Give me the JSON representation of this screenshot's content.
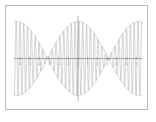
{
  "figure": {
    "background_color": "#ffffff",
    "frame_color": "#b9b9b9",
    "line_color": "#9e9e9e",
    "axis_color": "#8a8a8a",
    "title": "",
    "alt_description": "Beat pattern: high-frequency sine wave modulated by a low-frequency envelope"
  },
  "chart_data": {
    "type": "line",
    "title": "",
    "subtitle": "",
    "xlabel": "",
    "ylabel": "",
    "xlim": [
      -6.6,
      6.6
    ],
    "ylim": [
      -1.15,
      1.15
    ],
    "grid": false,
    "legend": null,
    "legend_position": "none",
    "xticks": [
      -6,
      -5,
      -4,
      -3,
      -2,
      -1,
      0,
      1,
      2,
      3,
      4,
      5,
      6
    ],
    "xticklabels": [
      "-6",
      "-5",
      "-4",
      "-3",
      "-2",
      "-1",
      "0",
      "1",
      "2",
      "3",
      "4",
      "5",
      "6"
    ],
    "yticks": [],
    "yticklabels": [],
    "annotations": [
      {
        "label": "node",
        "x": -3.14,
        "y": 0
      },
      {
        "label": "node",
        "x": 3.14,
        "y": 0
      },
      {
        "label": "antinode",
        "x": 0,
        "y": 1
      },
      {
        "label": "antinode",
        "x": -6.28,
        "y": 1
      },
      {
        "label": "antinode",
        "x": 6.28,
        "y": 1
      }
    ],
    "series": [
      {
        "name": "carrier",
        "kind": "oscillation",
        "expression": "sin(16x) * cos(0.5x)",
        "carrier_frequency": 16,
        "envelope_frequency": 0.5,
        "amplitude": 1,
        "color": "#9e9e9e"
      },
      {
        "name": "envelope-upper",
        "kind": "envelope",
        "expression": "cos(0.5x)",
        "amplitude": 1,
        "color": "#a8a8a8"
      },
      {
        "name": "envelope-lower",
        "kind": "envelope",
        "expression": "-cos(0.5x)",
        "amplitude": -1,
        "color": "#a8a8a8"
      }
    ]
  }
}
